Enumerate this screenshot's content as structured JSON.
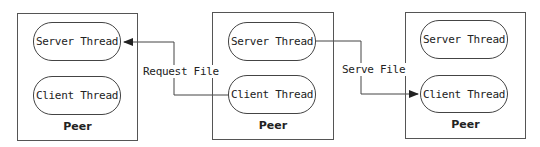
{
  "diagram": {
    "peers": [
      {
        "label": "Peer",
        "threads": [
          "Server Thread",
          "Client Thread"
        ]
      },
      {
        "label": "Peer",
        "threads": [
          "Server Thread",
          "Client Thread"
        ]
      },
      {
        "label": "Peer",
        "threads": [
          "Server Thread",
          "Client Thread"
        ]
      }
    ],
    "messages": [
      {
        "label": "Request File",
        "from": "peer-2.client-thread",
        "to": "peer-1.server-thread"
      },
      {
        "label": "Serve File",
        "from": "peer-2.server-thread",
        "to": "peer-3.client-thread"
      }
    ],
    "colors": {
      "line": "#444444",
      "background": "#ffffff",
      "text": "#222222"
    }
  }
}
